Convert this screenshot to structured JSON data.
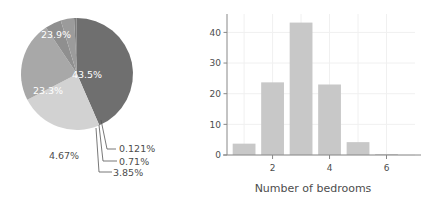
{
  "figure": {
    "background": "#ffffff",
    "text_color": "#4d4d4d"
  },
  "chart_data": [
    {
      "type": "pie",
      "title": "",
      "id": "bedrooms-pie",
      "labels": [
        "43.5%",
        "23.9%",
        "23.3%",
        "4.67%",
        "3.85%",
        "0.71%",
        "0.121%"
      ],
      "values": [
        43.5,
        23.9,
        23.3,
        4.67,
        3.85,
        0.71,
        0.121
      ],
      "colors": [
        "#6f6f6f",
        "#d2d2d2",
        "#a8a8a8",
        "#8f8f8f",
        "#9b9b9b",
        "#7d7d7d",
        "#747474"
      ],
      "label_placement": [
        "inside",
        "inside",
        "inside",
        "outside",
        "outside-leader",
        "outside-leader",
        "outside-leader"
      ],
      "start_angle_deg": 0,
      "direction": "clockwise",
      "legend": "none",
      "center_px": [
        77,
        74
      ],
      "radius_px": 56
    },
    {
      "type": "bar",
      "id": "bedrooms-bar",
      "title": "",
      "categories": [
        1,
        2,
        3,
        4,
        5,
        6
      ],
      "values": [
        3.7,
        23.7,
        43.2,
        23.0,
        4.2,
        0.3
      ],
      "bar_color": "#c8c8c8",
      "xlabel": "Number of bedrooms",
      "ylabel": "",
      "xlim": [
        0.4,
        7.0
      ],
      "ylim": [
        0,
        46
      ],
      "xticks": [
        2,
        4,
        6
      ],
      "xtick_labels": [
        "2",
        "4",
        "6"
      ],
      "yticks": [
        0,
        10,
        20,
        30,
        40
      ],
      "ytick_labels": [
        "0",
        "10",
        "20",
        "30",
        "40"
      ],
      "grid": "faint",
      "grid_color": "#f0f0f0",
      "axis_color": "#888888"
    }
  ]
}
